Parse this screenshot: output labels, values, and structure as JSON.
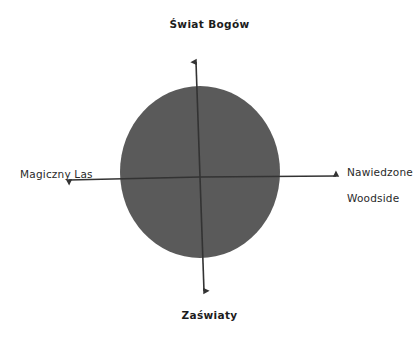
{
  "diagram": {
    "type": "four-quadrant-axis-diagram",
    "background_color": "#ffffff",
    "axis_color": "#333333",
    "ellipse": {
      "fill_color": "#5a5a5a",
      "center_x": 200,
      "center_y": 172,
      "radius_x": 80,
      "radius_y": 86
    },
    "axes": {
      "vertical": {
        "top_x": 196,
        "top_y": 58,
        "bottom_x": 204,
        "bottom_y": 295
      },
      "horizontal": {
        "left_x": 65,
        "left_y": 180,
        "right_x": 340,
        "right_y": 176
      },
      "origin_x": 200,
      "origin_y": 177
    },
    "labels": {
      "top": "Świat Bogów",
      "bottom": "Zaświaty",
      "left": "Magiczny Las",
      "right_line1": "Nawiedzone",
      "right_line2": "Woodside"
    }
  }
}
